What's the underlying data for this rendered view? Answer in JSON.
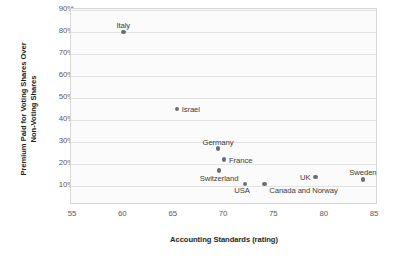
{
  "chart_data": {
    "type": "scatter",
    "title": "",
    "xlabel": "Accounting Standards (rating)",
    "ylabel_line1": "Premium Paid for Voting Shares Over",
    "ylabel_line2": "Non-Voting Shares",
    "xlim": [
      55,
      85
    ],
    "ylim": [
      5,
      90
    ],
    "xticks": [
      "55",
      "60",
      "65",
      "70",
      "75",
      "80",
      "85"
    ],
    "xtick_values": [
      55,
      60,
      65,
      70,
      75,
      80,
      85
    ],
    "yticks": [
      "10%",
      "20%",
      "30%",
      "40%",
      "50%",
      "60%",
      "70%",
      "80%",
      "90%"
    ],
    "ytick_values": [
      10,
      20,
      30,
      40,
      50,
      60,
      70,
      80,
      90
    ],
    "grid": "horizontal",
    "legend": "none",
    "points": [
      {
        "label": "Italy",
        "x": 60.0,
        "y": 80,
        "label_pos": "center",
        "label_dx": 0,
        "label_dy": -11
      },
      {
        "label": "Israel",
        "x": 65.3,
        "y": 45,
        "label_pos": "right",
        "label_dx": 5,
        "label_dy": -4
      },
      {
        "label": "Germany",
        "x": 69.4,
        "y": 27,
        "label_pos": "center",
        "label_dx": 0,
        "label_dy": -11
      },
      {
        "label": "France",
        "x": 70.0,
        "y": 22,
        "label_pos": "right",
        "label_dx": 5,
        "label_dy": -4
      },
      {
        "label": "Switzerland",
        "x": 69.5,
        "y": 17,
        "label_pos": "center",
        "label_dx": 0,
        "label_dy": 3
      },
      {
        "label": "USA",
        "x": 72.1,
        "y": 11,
        "label_pos": "center",
        "label_dx": -3,
        "label_dy": 2
      },
      {
        "label": "Canada and Norway",
        "x": 74.0,
        "y": 11,
        "label_pos": "right",
        "label_dx": 5,
        "label_dy": 2
      },
      {
        "label": "UK",
        "x": 79.1,
        "y": 14,
        "label_pos": "left",
        "label_dx": -5,
        "label_dy": -4
      },
      {
        "label": "Sweden",
        "x": 83.8,
        "y": 13,
        "label_pos": "center",
        "label_dx": 0,
        "label_dy": -11
      }
    ],
    "colors": {
      "point": "#6d6e71",
      "grid": "#e2e2e2",
      "frame": "#d6d6d6",
      "plot_bg": "#fbfbfb",
      "tick_text": "#58595b",
      "axis_title": "#231f20",
      "point_label": "#3b3b3d"
    }
  }
}
